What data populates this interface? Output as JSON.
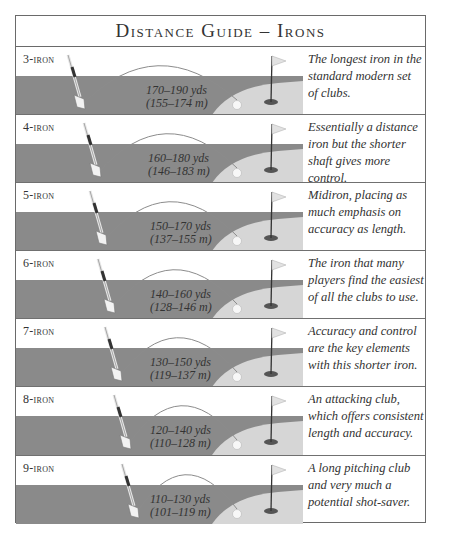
{
  "title": "Distance Guide – Irons",
  "colors": {
    "fairway": "#8a8a8a",
    "green": "#d6d6d6",
    "border": "#6a6a6a",
    "text": "#333333"
  },
  "rows": [
    {
      "club": "3-iron",
      "yards": "170–190 yds",
      "meters": "(155–174 m)",
      "description": "The longest iron in the standard modern set of clubs.",
      "club_x": 60,
      "dist_x": 130
    },
    {
      "club": "4-iron",
      "yards": "160–180 yds",
      "meters": "(146–183 m)",
      "description": "Essentially a distance iron but the shorter shaft gives more control.",
      "club_x": 76,
      "dist_x": 132
    },
    {
      "club": "5-iron",
      "yards": "150–170 yds",
      "meters": "(137–155 m)",
      "description": "Midiron, placing as much emphasis on accuracy as length.",
      "club_x": 82,
      "dist_x": 134
    },
    {
      "club": "6-iron",
      "yards": "140–160 yds",
      "meters": "(128–146 m)",
      "description": "The iron that many players find the easiest of all the clubs to use.",
      "club_x": 90,
      "dist_x": 134
    },
    {
      "club": "7-iron",
      "yards": "130–150 yds",
      "meters": "(119–137 m)",
      "description": "Accuracy and control are the key elements with this shorter iron.",
      "club_x": 97,
      "dist_x": 134
    },
    {
      "club": "8-iron",
      "yards": "120–140 yds",
      "meters": "(110–128 m)",
      "description": "An attacking club, which offers consistent length and accuracy.",
      "club_x": 106,
      "dist_x": 134
    },
    {
      "club": "9-iron",
      "yards": "110–130 yds",
      "meters": "(101–119 m)",
      "description": "A long pitching club and very much a potential shot-saver.",
      "club_x": 114,
      "dist_x": 134
    }
  ],
  "icons": {
    "club": "golf-club-icon",
    "ball": "golf-ball-icon",
    "flag": "flag-icon",
    "hole": "hole-icon"
  }
}
